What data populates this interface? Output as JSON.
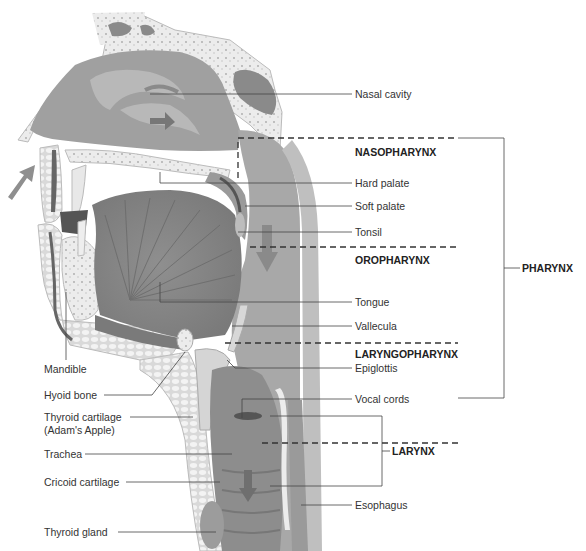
{
  "figure": {
    "caption_visible": "Figure ... (cut off)"
  },
  "labels_right": [
    {
      "id": "nasal-cavity",
      "text": "Nasal cavity"
    },
    {
      "id": "hard-palate",
      "text": "Hard palate"
    },
    {
      "id": "soft-palate",
      "text": "Soft palate"
    },
    {
      "id": "tonsil",
      "text": "Tonsil"
    },
    {
      "id": "tongue",
      "text": "Tongue"
    },
    {
      "id": "vallecula",
      "text": "Vallecula"
    },
    {
      "id": "epiglottis",
      "text": "Epiglottis"
    },
    {
      "id": "vocal-cords",
      "text": "Vocal cords"
    },
    {
      "id": "esophagus",
      "text": "Esophagus"
    }
  ],
  "labels_left": [
    {
      "id": "mandible",
      "text": "Mandible"
    },
    {
      "id": "hyoid-bone",
      "text": "Hyoid bone"
    },
    {
      "id": "thyroid-cartilage",
      "text": "Thyroid cartilage"
    },
    {
      "id": "thyroid-cartilage-sub",
      "text": "(Adam's Apple)"
    },
    {
      "id": "trachea",
      "text": "Trachea"
    },
    {
      "id": "cricoid-cartilage",
      "text": "Cricoid cartilage"
    },
    {
      "id": "thyroid-gland",
      "text": "Thyroid gland"
    }
  ],
  "regions": {
    "nasopharynx": "NASOPHARYNX",
    "oropharynx": "OROPHARYNX",
    "laryngopharynx": "LARYNGOPHARYNX",
    "pharynx": "PHARYNX",
    "larynx": "LARYNX"
  },
  "colors": {
    "bone": "#e6e6e6",
    "tissue_dark": "#8a8a8a",
    "tissue_mid": "#a6a6a6",
    "tissue_light": "#c8c8c8",
    "line": "#444444"
  }
}
